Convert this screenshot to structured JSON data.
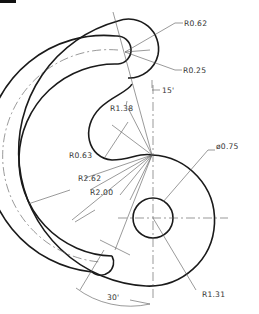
{
  "drawing": {
    "title": "",
    "dimensions": {
      "r_slot_end_outer": "R0.62",
      "r_slot_end_inner": "R0.25",
      "angle_top": "15'",
      "r_notch": "R1.38",
      "r_notch_small": "R0.63",
      "r_outer": "R2.62",
      "r_slot_center": "R2.00",
      "hole_diameter": "ø0.75",
      "angle_bottom": "30'",
      "r_lobe": "R1.31"
    },
    "colors": {
      "object_line": "#1a1a1a",
      "dimension_line": "#555555",
      "background": "#ffffff"
    }
  }
}
